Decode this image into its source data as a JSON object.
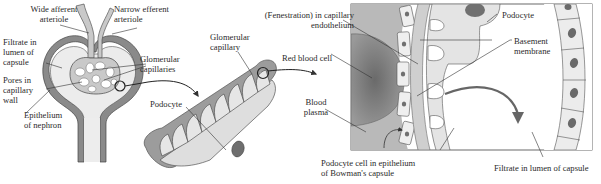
{
  "diagram": {
    "colors": {
      "capillary_fill": "#c9c9c9",
      "capillary_stroke": "#5a5a5a",
      "capsule_fill": "#e9e9e9",
      "epithelium_fill": "#8a8a8a",
      "nucleus": "#6e6e6e",
      "red_blood_cell": "#7c7c7c",
      "plasma": "#b5b5b5",
      "line": "#333333"
    },
    "panels": [
      {
        "id": "left",
        "name": "Renal corpuscle (Bowman's capsule and glomerulus)",
        "labels": {
          "afferent": "Wide afferent\narteriole",
          "efferent": "Narrow efferent\narteriole",
          "filtrate": "Filtrate in\nlumen of\ncapsule",
          "capillaries": "Glomerular\ncapillaries",
          "pores": "Pores in\ncapillary\nwall",
          "epithelium": "Epithelium\nof nephron"
        }
      },
      {
        "id": "middle",
        "name": "Podocyte wrapped around glomerular capillary",
        "labels": {
          "glom_capillary": "Glomerular\ncapillary",
          "podocyte": "Podocyte"
        }
      },
      {
        "id": "right",
        "name": "Filtration barrier detail",
        "labels": {
          "fenestration": "(Fenestration) in capillary\nendothelium",
          "podocyte": "Podocyte",
          "basement": "Basement\nmembrane",
          "rbc": "Red blood cell",
          "plasma": "Blood\nplasma",
          "podocyte_cell": "Podocyte cell in epithelium\nof Bowman's capsule",
          "filtrate": "Filtrate in lumen of capsule"
        }
      }
    ]
  }
}
